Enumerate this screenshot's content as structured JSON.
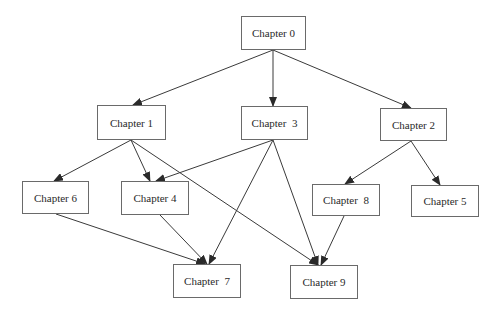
{
  "diagram": {
    "type": "directed-graph",
    "colors": {
      "background": "#ffffff",
      "node_border": "#6a6a6a",
      "edge": "#3a3a3a",
      "text": "#2a2a2a"
    },
    "nodes": [
      {
        "id": "ch0",
        "label": "Chapter 0",
        "x": 241,
        "y": 16,
        "w": 65,
        "h": 34
      },
      {
        "id": "ch1",
        "label": "Chapter 1",
        "x": 97,
        "y": 105,
        "w": 69,
        "h": 35
      },
      {
        "id": "ch3",
        "label": "Chapter  3",
        "x": 241,
        "y": 106,
        "w": 67,
        "h": 34
      },
      {
        "id": "ch2",
        "label": "Chapter 2",
        "x": 380,
        "y": 108,
        "w": 67,
        "h": 33
      },
      {
        "id": "ch6",
        "label": "Chapter 6",
        "x": 22,
        "y": 181,
        "w": 67,
        "h": 33
      },
      {
        "id": "ch4",
        "label": "Chapter 4",
        "x": 121,
        "y": 181,
        "w": 68,
        "h": 34
      },
      {
        "id": "ch8",
        "label": "Chapter  8",
        "x": 312,
        "y": 184,
        "w": 68,
        "h": 32
      },
      {
        "id": "ch5",
        "label": "Chapter 5",
        "x": 411,
        "y": 185,
        "w": 68,
        "h": 32
      },
      {
        "id": "ch7",
        "label": "Chapter  7",
        "x": 173,
        "y": 264,
        "w": 68,
        "h": 34
      },
      {
        "id": "ch9",
        "label": "Chapter 9",
        "x": 290,
        "y": 265,
        "w": 68,
        "h": 34
      }
    ],
    "edges": [
      {
        "from": "ch0",
        "to": "ch1",
        "x1": 273,
        "y1": 50,
        "x2": 133,
        "y2": 105
      },
      {
        "from": "ch0",
        "to": "ch3",
        "x1": 273,
        "y1": 50,
        "x2": 273,
        "y2": 106
      },
      {
        "from": "ch0",
        "to": "ch2",
        "x1": 273,
        "y1": 50,
        "x2": 411,
        "y2": 108
      },
      {
        "from": "ch1",
        "to": "ch6",
        "x1": 131,
        "y1": 140,
        "x2": 54,
        "y2": 181
      },
      {
        "from": "ch1",
        "to": "ch4",
        "x1": 131,
        "y1": 140,
        "x2": 150,
        "y2": 181
      },
      {
        "from": "ch1",
        "to": "ch9",
        "x1": 131,
        "y1": 140,
        "x2": 318,
        "y2": 265
      },
      {
        "from": "ch3",
        "to": "ch4",
        "x1": 273,
        "y1": 140,
        "x2": 156,
        "y2": 181
      },
      {
        "from": "ch3",
        "to": "ch7",
        "x1": 273,
        "y1": 140,
        "x2": 209,
        "y2": 264
      },
      {
        "from": "ch3",
        "to": "ch9",
        "x1": 273,
        "y1": 140,
        "x2": 318,
        "y2": 265
      },
      {
        "from": "ch2",
        "to": "ch8",
        "x1": 411,
        "y1": 141,
        "x2": 345,
        "y2": 184
      },
      {
        "from": "ch2",
        "to": "ch5",
        "x1": 411,
        "y1": 141,
        "x2": 440,
        "y2": 185
      },
      {
        "from": "ch6",
        "to": "ch7",
        "x1": 56,
        "y1": 214,
        "x2": 205,
        "y2": 264
      },
      {
        "from": "ch4",
        "to": "ch7",
        "x1": 160,
        "y1": 215,
        "x2": 207,
        "y2": 264
      },
      {
        "from": "ch8",
        "to": "ch9",
        "x1": 344,
        "y1": 216,
        "x2": 321,
        "y2": 265
      }
    ]
  }
}
